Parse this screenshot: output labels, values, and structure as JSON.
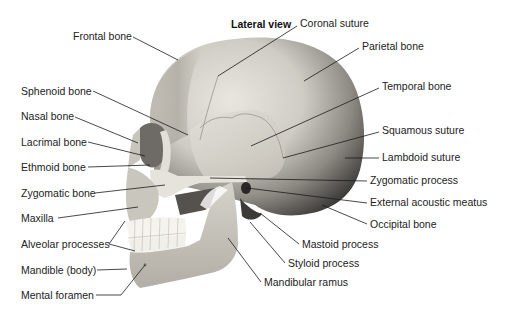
{
  "diagram": {
    "title": "Lateral view",
    "labels_left": [
      {
        "id": "frontal-bone",
        "text": "Frontal bone"
      },
      {
        "id": "sphenoid-bone",
        "text": "Sphenoid bone"
      },
      {
        "id": "nasal-bone",
        "text": "Nasal bone"
      },
      {
        "id": "lacrimal-bone",
        "text": "Lacrimal bone"
      },
      {
        "id": "ethmoid-bone",
        "text": "Ethmoid bone"
      },
      {
        "id": "zygomatic-bone",
        "text": "Zygomatic bone"
      },
      {
        "id": "maxilla",
        "text": "Maxilla"
      },
      {
        "id": "alveolar-processes",
        "text": "Alveolar processes"
      },
      {
        "id": "mandible-body",
        "text": "Mandible (body)"
      },
      {
        "id": "mental-foramen",
        "text": "Mental foramen"
      }
    ],
    "labels_right": [
      {
        "id": "coronal-suture",
        "text": "Coronal suture"
      },
      {
        "id": "parietal-bone",
        "text": "Parietal bone"
      },
      {
        "id": "temporal-bone",
        "text": "Temporal bone"
      },
      {
        "id": "squamous-suture",
        "text": "Squamous suture"
      },
      {
        "id": "lambdoid-suture",
        "text": "Lambdoid suture"
      },
      {
        "id": "zygomatic-process",
        "text": "Zygomatic process"
      },
      {
        "id": "external-acoustic-meatus",
        "text": "External acoustic meatus"
      },
      {
        "id": "occipital-bone",
        "text": "Occipital bone"
      },
      {
        "id": "mastoid-process",
        "text": "Mastoid process"
      },
      {
        "id": "styloid-process",
        "text": "Styloid process"
      },
      {
        "id": "mandibular-ramus",
        "text": "Mandibular ramus"
      }
    ],
    "colors": {
      "background": "#ffffff",
      "text": "#222222",
      "leader_line": "#1a1a1a",
      "bone_light": "#e4e1d8",
      "bone_mid": "#b9b6ad",
      "bone_dark": "#4a4845"
    }
  }
}
